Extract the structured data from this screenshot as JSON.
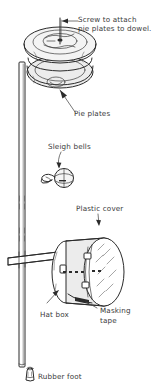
{
  "diagram": {
    "background_color": "#ffffff",
    "ink_color": "#2b2b2b",
    "text_color": "#3a3a3a",
    "style": "hand-drawn line illustration"
  },
  "labels": [
    {
      "id": "screw",
      "text_line1": "Screw to attach",
      "text_line2": "pie plates to dowel.",
      "pointer": "arrow-left",
      "target": "screw head at top of pie plate stack"
    },
    {
      "id": "pie_plates",
      "text": "Pie plates",
      "pointer": "arrow-up-left",
      "target": "stacked pie plates"
    },
    {
      "id": "sleigh_bells",
      "text": "Sleigh bells",
      "pointer": "arrow-down",
      "target": "sleigh bell on wire clip"
    },
    {
      "id": "plastic_cover",
      "text": "Plastic cover",
      "pointer": "arrow-down",
      "target": "plastic cover on hat box drum head"
    },
    {
      "id": "masking_tape",
      "text_line1": "Masking",
      "text_line2": "tape",
      "pointer": "curved-leader-left",
      "target": "tape securing cover to hat box rim"
    },
    {
      "id": "hat_box",
      "text": "Hat box",
      "pointer": "arrow-up-right",
      "target": "cylindrical hat box drum body"
    },
    {
      "id": "rubber_foot",
      "text": "Rubber foot",
      "pointer": "glyph-left",
      "target": "rubber foot at bottom of dowel"
    }
  ],
  "parts": [
    {
      "name": "dowel",
      "description": "long vertical wooden dowel running the full height"
    },
    {
      "name": "pie-plates",
      "description": "two stacked metal pie plates at the top"
    },
    {
      "name": "screw",
      "description": "screw through center of pie plates into dowel"
    },
    {
      "name": "sleigh-bell",
      "description": "sleigh bell with wire clip, mid-height"
    },
    {
      "name": "hat-box-drum",
      "description": "cylindrical hat box used as a drum"
    },
    {
      "name": "plastic-cover",
      "description": "translucent plastic cover over drum head"
    },
    {
      "name": "masking-tape",
      "description": "masking tape strip securing the cover"
    },
    {
      "name": "crossbar",
      "description": "horizontal bar through the dowel below the pie plates"
    },
    {
      "name": "rubber-foot",
      "description": "rubber foot cap on the bottom of the dowel"
    }
  ]
}
